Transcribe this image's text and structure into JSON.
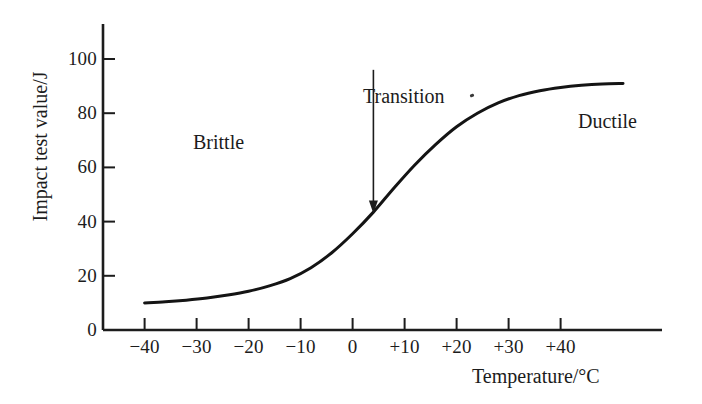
{
  "chart_data": {
    "type": "line",
    "title": "",
    "xlabel": "Temperature/°C",
    "ylabel": "Impact test value/J",
    "xlim": [
      -48,
      57
    ],
    "ylim": [
      0,
      113
    ],
    "grid": false,
    "legend": "none",
    "x_ticks": [
      "−40",
      "−30",
      "−20",
      "−10",
      "0",
      "+10",
      "+20",
      "+30",
      "+40"
    ],
    "x_tick_values": [
      -40,
      -30,
      -20,
      -10,
      0,
      10,
      20,
      30,
      40
    ],
    "y_ticks": [
      "0",
      "20",
      "40",
      "60",
      "80",
      "100"
    ],
    "y_tick_values": [
      0,
      20,
      40,
      60,
      80,
      100
    ],
    "series": [
      {
        "name": "Impact test value",
        "x": [
          -40,
          -36,
          -32,
          -28,
          -24,
          -20,
          -16,
          -12,
          -8,
          -4,
          0,
          4,
          8,
          12,
          16,
          20,
          24,
          28,
          32,
          36,
          40,
          44,
          48,
          52
        ],
        "values": [
          10,
          10.4,
          11,
          11.8,
          12.9,
          14.3,
          16.3,
          19,
          23,
          28.5,
          35.5,
          43.5,
          52.5,
          61,
          68.5,
          75,
          80,
          83.8,
          86.5,
          88.3,
          89.5,
          90.3,
          90.8,
          91
        ]
      }
    ],
    "annotations": [
      {
        "name": "brittle",
        "text": "Brittle",
        "x": -22,
        "y": 73
      },
      {
        "name": "transition",
        "text": "Transition",
        "x": 5,
        "y": 100,
        "arrow": {
          "tip_x": 4,
          "tip_y": 43,
          "tail_x": 4,
          "tail_y": 96
        }
      },
      {
        "name": "ductile",
        "text": "Ductile",
        "x": 35,
        "y": 81
      }
    ]
  },
  "axes": {
    "x_title": "Temperature/°C",
    "y_title": "Impact test value/J",
    "x_tick_labels": [
      "−40",
      "−30",
      "−20",
      "−10",
      "0",
      "+10",
      "+20",
      "+30",
      "+40"
    ],
    "y_tick_labels": [
      "0",
      "20",
      "40",
      "60",
      "80",
      "100"
    ]
  },
  "labels": {
    "brittle": "Brittle",
    "transition": "Transition",
    "ductile": "Ductile"
  },
  "colors": {
    "background": "#ffffff",
    "ink": "#1c1c1c",
    "curve": "#141414"
  }
}
